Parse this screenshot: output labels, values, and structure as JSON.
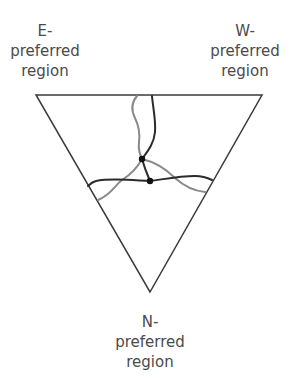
{
  "labels": {
    "e": {
      "line1": "E-",
      "line2": "preferred",
      "line3": "region"
    },
    "w": {
      "line1": "W-",
      "line2": "preferred",
      "line3": "region"
    },
    "n": {
      "line1": "N-",
      "line2": "preferred",
      "line3": "region"
    }
  },
  "diagram": {
    "shape": "inverted-triangle",
    "vertices": {
      "top_left": [
        36,
        95
      ],
      "top_right": [
        262,
        95
      ],
      "bottom": [
        150,
        292
      ]
    },
    "curves": [
      {
        "name": "dark-boundary",
        "color": "#2b2b2b"
      },
      {
        "name": "gray-boundary",
        "color": "#8a8a8a"
      }
    ],
    "triple_points": [
      {
        "name": "upper-triple-point",
        "x": 142,
        "y": 159
      },
      {
        "name": "lower-triple-point",
        "x": 150,
        "y": 181
      }
    ]
  }
}
